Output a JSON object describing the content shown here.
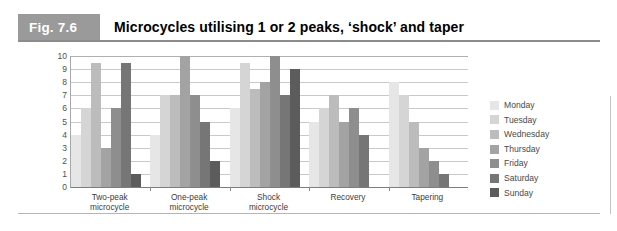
{
  "figure": {
    "number_label": "Fig. 7.6",
    "title": "Microcycles utilising 1 or 2 peaks, ‘shock’ and taper"
  },
  "colors": {
    "header_number_bg": "#9a9a9a",
    "header_rule": "#8c8c8c",
    "axis": "#7d7d7d",
    "gridline": "#c9c9c9",
    "series": [
      "#e6e6e6",
      "#d5d5d5",
      "#bcbcbc",
      "#a3a3a3",
      "#8e8e8e",
      "#767676",
      "#5c5c5c"
    ]
  },
  "chart_data": {
    "type": "bar",
    "title": "Microcycles utilising 1 or 2 peaks, ‘shock’ and taper",
    "xlabel": "",
    "ylabel": "",
    "ylim": [
      0,
      10
    ],
    "yticks": [
      10,
      9,
      8,
      7,
      6,
      5,
      4,
      3,
      2,
      1,
      0
    ],
    "grid": true,
    "legend_position": "right",
    "categories": [
      "Two-peak microcycle",
      "One-peak microcycle",
      "Shock microcycle",
      "Recovery",
      "Tapering"
    ],
    "category_lines": [
      [
        "Two-peak",
        "microcycle"
      ],
      [
        "One-peak",
        "microcycle"
      ],
      [
        "Shock",
        "microcycle"
      ],
      [
        "Recovery",
        ""
      ],
      [
        "Tapering",
        ""
      ]
    ],
    "series": [
      {
        "name": "Monday",
        "color": "#e6e6e6",
        "values": [
          4,
          4,
          6,
          5,
          8
        ]
      },
      {
        "name": "Tuesday",
        "color": "#d5d5d5",
        "values": [
          6,
          7,
          9.5,
          6,
          7
        ]
      },
      {
        "name": "Wednesday",
        "color": "#bcbcbc",
        "values": [
          9.5,
          7,
          7.5,
          7,
          5
        ]
      },
      {
        "name": "Thursday",
        "color": "#a3a3a3",
        "values": [
          3,
          10,
          8,
          5,
          3
        ]
      },
      {
        "name": "Friday",
        "color": "#8e8e8e",
        "values": [
          6,
          7,
          10,
          6,
          2
        ]
      },
      {
        "name": "Saturday",
        "color": "#767676",
        "values": [
          9.5,
          5,
          7,
          4,
          1
        ]
      },
      {
        "name": "Sunday",
        "color": "#5c5c5c",
        "values": [
          1,
          2,
          9,
          0,
          0
        ]
      }
    ]
  },
  "legend": {
    "items": [
      {
        "label": "Monday",
        "color": "#e6e6e6"
      },
      {
        "label": "Tuesday",
        "color": "#d5d5d5"
      },
      {
        "label": "Wednesday",
        "color": "#bcbcbc"
      },
      {
        "label": "Thursday",
        "color": "#a3a3a3"
      },
      {
        "label": "Friday",
        "color": "#8e8e8e"
      },
      {
        "label": "Saturday",
        "color": "#767676"
      },
      {
        "label": "Sunday",
        "color": "#5c5c5c"
      }
    ]
  }
}
